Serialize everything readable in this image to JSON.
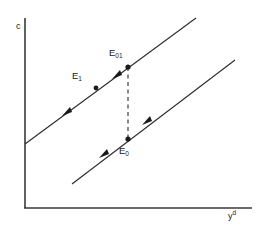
{
  "figure": {
    "axes": {
      "y_label": "c",
      "x_label_base": "y",
      "x_label_sup": "d",
      "color": "#3a3a3a"
    },
    "points": [
      {
        "id": "E1",
        "label_base": "E",
        "label_sub": "1",
        "x": 96,
        "y": 88
      },
      {
        "id": "E01",
        "label_base": "E",
        "label_sub": "01",
        "x": 128,
        "y": 67
      },
      {
        "id": "E0",
        "label_base": "E",
        "label_sub": "0",
        "x": 128,
        "y": 139
      }
    ],
    "lines": {
      "upper_line": {
        "x1": 25,
        "y1": 144,
        "x2": 196,
        "y2": 18,
        "color": "#2b2b2b"
      },
      "lower_line": {
        "x1": 72,
        "y1": 184,
        "x2": 235,
        "y2": 60,
        "color": "#2b2b2b"
      },
      "connector": {
        "x1": 128,
        "y1": 67,
        "x2": 128,
        "y2": 139,
        "color": "#2b2b2b",
        "style": "dashed"
      }
    },
    "arrow_color": "#1a1a1a",
    "marker_color": "#1a1a1a"
  }
}
